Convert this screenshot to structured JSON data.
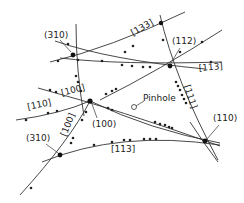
{
  "diagram": {
    "poles": [
      {
        "id": "p310a",
        "label": "(310)",
        "x": 72,
        "y": 54
      },
      {
        "id": "p112",
        "label": "(112)",
        "x": 170,
        "y": 65
      },
      {
        "id": "p100",
        "label": "(100)",
        "x": 90,
        "y": 101
      },
      {
        "id": "p310b",
        "label": "(310)",
        "x": 60,
        "y": 155
      },
      {
        "id": "p110",
        "label": "(110)",
        "x": 205,
        "y": 141
      },
      {
        "id": "p133",
        "label": "",
        "x": 161,
        "y": 23
      }
    ],
    "pole_labels": [
      {
        "text": "(310)",
        "x": 44,
        "y": 38
      },
      {
        "text": "(112)",
        "x": 172,
        "y": 44
      },
      {
        "text": "(100)",
        "x": 92,
        "y": 127
      },
      {
        "text": "(310)",
        "x": 26,
        "y": 141
      },
      {
        "text": "(110)",
        "x": 213,
        "y": 121
      }
    ],
    "zone_labels": [
      {
        "text": "[133]",
        "x": 133,
        "y": 36,
        "rotate": -30
      },
      {
        "text": "[113]",
        "x": 199,
        "y": 71,
        "rotate": -5
      },
      {
        "text": "[100]",
        "x": 62,
        "y": 96,
        "rotate": -15
      },
      {
        "text": "[110]",
        "x": 28,
        "y": 110,
        "rotate": -12
      },
      {
        "text": "[111]",
        "x": 181,
        "y": 95,
        "rotate": 72
      },
      {
        "text": "[100]",
        "x": 62,
        "y": 140,
        "rotate": -68
      },
      {
        "text": "[113]",
        "x": 111,
        "y": 150,
        "rotate": 0
      }
    ],
    "pinhole": {
      "label": "Pinhole",
      "x": 134,
      "y": 107,
      "label_x": 146,
      "label_y": 101
    }
  }
}
